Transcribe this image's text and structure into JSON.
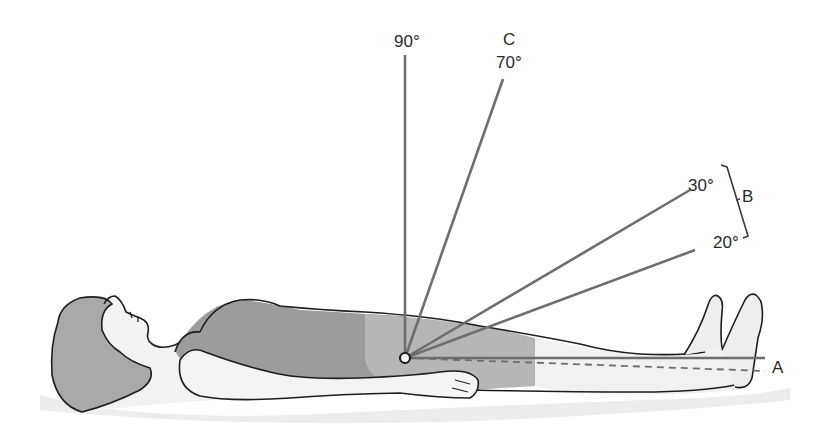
{
  "figure": {
    "pivot_point": "hip-joint",
    "labels": {
      "angle_90": "90°",
      "angle_70": "70°",
      "angle_30": "30°",
      "angle_20": "20°",
      "label_A": "A",
      "label_B": "B",
      "label_C": "C"
    },
    "angles_deg": [
      0,
      20,
      30,
      70,
      90
    ],
    "groups": {
      "A": "0° reference (horizontal)",
      "B": "20°–30° range",
      "C": "70°"
    },
    "colors": {
      "line": "#6e6e6e",
      "body_outline": "#1e1e1e",
      "shirt": "#9a9a9a",
      "shorts": "#b4b4b4",
      "skin": "#eeeeee",
      "hair": "#a8a8a8",
      "shadow": "#e4e4e4"
    }
  }
}
